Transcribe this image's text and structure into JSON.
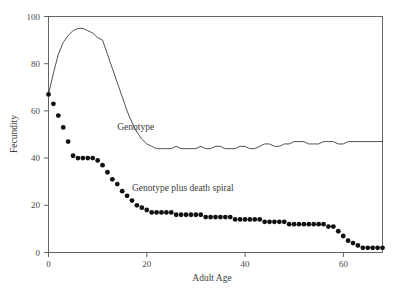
{
  "chart_data": {
    "type": "line",
    "title": "",
    "xlabel": "Adult Age",
    "ylabel": "Fecundity",
    "xlim": [
      0,
      68
    ],
    "ylim": [
      0,
      100
    ],
    "xticks": [
      0,
      20,
      40,
      60
    ],
    "yticks": [
      0,
      20,
      40,
      60,
      80,
      100
    ],
    "grid": false,
    "legend_position": "inline-annotations",
    "series": [
      {
        "name": "Genotype",
        "style": "line",
        "color": "#3d3d3d",
        "label_text": "Genotype",
        "x": [
          0,
          1,
          2,
          3,
          4,
          5,
          6,
          7,
          8,
          9,
          10,
          11,
          12,
          13,
          14,
          15,
          16,
          17,
          18,
          19,
          20,
          21,
          22,
          23,
          24,
          25,
          26,
          27,
          28,
          29,
          30,
          31,
          32,
          33,
          34,
          35,
          36,
          37,
          38,
          39,
          40,
          41,
          42,
          43,
          44,
          45,
          46,
          47,
          48,
          49,
          50,
          51,
          52,
          53,
          54,
          55,
          56,
          57,
          58,
          59,
          60,
          61,
          62,
          63,
          64,
          65,
          66,
          67,
          68
        ],
        "y": [
          67,
          76,
          84,
          89,
          92,
          94,
          95,
          95,
          94,
          93,
          91,
          90,
          84,
          78,
          72,
          66,
          60,
          55,
          51,
          48,
          46,
          45,
          44,
          44,
          44,
          44,
          45,
          44,
          44,
          44,
          44,
          45,
          44,
          44,
          45,
          45,
          44,
          44,
          44,
          45,
          45,
          44,
          44,
          45,
          46,
          46,
          45,
          45,
          46,
          46,
          47,
          47,
          47,
          46,
          46,
          46,
          47,
          47,
          47,
          46,
          46,
          47,
          47,
          47,
          47,
          47,
          47,
          47,
          47
        ]
      },
      {
        "name": "Genotype plus death spiral",
        "style": "markers",
        "color": "#111111",
        "label_text": "Genotype plus death spiral",
        "x": [
          0,
          1,
          2,
          3,
          4,
          5,
          6,
          7,
          8,
          9,
          10,
          11,
          12,
          13,
          14,
          15,
          16,
          17,
          18,
          19,
          20,
          21,
          22,
          23,
          24,
          25,
          26,
          27,
          28,
          29,
          30,
          31,
          32,
          33,
          34,
          35,
          36,
          37,
          38,
          39,
          40,
          41,
          42,
          43,
          44,
          45,
          46,
          47,
          48,
          49,
          50,
          51,
          52,
          53,
          54,
          55,
          56,
          57,
          58,
          59,
          60,
          61,
          62,
          63,
          64,
          65,
          66,
          67,
          68
        ],
        "y": [
          67,
          63,
          58,
          53,
          47,
          41,
          40,
          40,
          40,
          40,
          39,
          37,
          34,
          31,
          29,
          26,
          24,
          22,
          20,
          19,
          18,
          17,
          17,
          17,
          17,
          17,
          16,
          16,
          16,
          16,
          16,
          16,
          15,
          15,
          15,
          15,
          15,
          15,
          14,
          14,
          14,
          14,
          14,
          14,
          13,
          13,
          13,
          13,
          13,
          12,
          12,
          12,
          12,
          12,
          12,
          12,
          12,
          11,
          11,
          9,
          7,
          5,
          4,
          3,
          2,
          2,
          2,
          2,
          2
        ]
      }
    ],
    "annotations": [
      {
        "text": "Genotype",
        "x": 14,
        "y": 52
      },
      {
        "text": "Genotype plus death spiral",
        "x": 17,
        "y": 26
      }
    ]
  },
  "axis": {
    "x_title": "Adult Age",
    "y_title": "Fecundity",
    "x_tick_labels": [
      "0",
      "20",
      "40",
      "60"
    ],
    "y_tick_labels": [
      "0",
      "20",
      "40",
      "60",
      "80",
      "100"
    ]
  },
  "caption": {
    "line1": ""
  }
}
